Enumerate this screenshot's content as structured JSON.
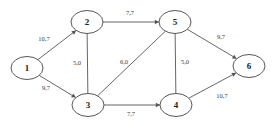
{
  "diagram": {
    "type": "directed-network-graph",
    "width": 277,
    "height": 127,
    "background_color": "#ffffff",
    "stroke_color": "#555555",
    "label_color": "#3a3a3a",
    "node_label_color": "#222222",
    "nodes": [
      {
        "id": "1",
        "label": "1",
        "cx": 27,
        "cy": 68,
        "rx": 16,
        "ry": 11.5
      },
      {
        "id": "2",
        "label": "2",
        "cx": 87,
        "cy": 22,
        "rx": 16,
        "ry": 11.5
      },
      {
        "id": "3",
        "label": "3",
        "cx": 88,
        "cy": 105,
        "rx": 16,
        "ry": 11.5
      },
      {
        "id": "4",
        "label": "4",
        "cx": 176,
        "cy": 105,
        "rx": 16,
        "ry": 11.5
      },
      {
        "id": "5",
        "label": "5",
        "cx": 175,
        "cy": 22,
        "rx": 16,
        "ry": 11.5
      },
      {
        "id": "6",
        "label": "6",
        "cx": 249,
        "cy": 66,
        "rx": 16,
        "ry": 11.5
      }
    ],
    "edges": [
      {
        "id": "e-1-2",
        "from": "1",
        "to": "2",
        "label": "10,7",
        "label_x": 44,
        "label_y": 40,
        "arrow": true
      },
      {
        "id": "e-1-3",
        "from": "1",
        "to": "3",
        "label": "9,7",
        "label_x": 46,
        "label_y": 89,
        "arrow": true
      },
      {
        "id": "e-2-5",
        "from": "2",
        "to": "5",
        "label": "7,7",
        "label_x": 130,
        "label_y": 14,
        "arrow": true
      },
      {
        "id": "e-2-3",
        "from": "2",
        "to": "3",
        "label": "5,0",
        "label_x": 77,
        "label_y": 64,
        "arrow": false
      },
      {
        "id": "e-3-5",
        "from": "3",
        "to": "5",
        "label": "6,0",
        "label_x": 124,
        "label_y": 63,
        "arrow": false
      },
      {
        "id": "e-3-4",
        "from": "3",
        "to": "4",
        "label": "7,7",
        "label_x": 131,
        "label_y": 115,
        "arrow": true
      },
      {
        "id": "e-5-4",
        "from": "5",
        "to": "4",
        "label": "5,0",
        "label_x": 185,
        "label_y": 63,
        "arrow": false
      },
      {
        "id": "e-5-6",
        "from": "5",
        "to": "6",
        "label": "9,7",
        "label_x": 221,
        "label_y": 38,
        "arrow": true
      },
      {
        "id": "e-4-6",
        "from": "4",
        "to": "6",
        "label": "10,7",
        "label_x": 222,
        "label_y": 97,
        "arrow": true
      }
    ]
  }
}
